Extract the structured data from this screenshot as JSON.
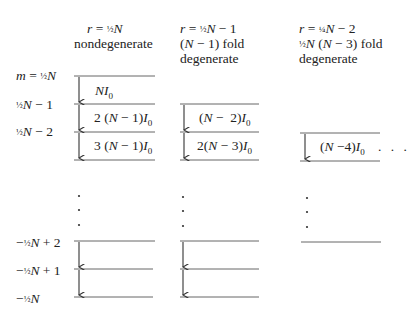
{
  "columns": [
    {
      "header_line1": "r = ½N",
      "header_line2": "nondegenerate",
      "header_line3": "",
      "transitions": [
        "NI₀",
        "2 (N − 1)I₀",
        "3 (N − 1)I₀"
      ]
    },
    {
      "header_line1": "r = ½N − 1",
      "header_line2": "(N − 1) fold",
      "header_line3": "degenerate",
      "transitions": [
        "(N −  2)I₀",
        "2(N − 3)I₀"
      ]
    },
    {
      "header_line1": "r = ¼N − 2",
      "header_line2": "½N (N − 3) fold",
      "header_line3": "degenerate",
      "transitions": [
        "(N −4)I₀"
      ],
      "trailing": ". . ."
    }
  ],
  "m_labels": {
    "top": [
      "m = ½N",
      "½N − 1",
      "½N − 2"
    ],
    "bottom": [
      "−½N + 2",
      "−½N + 1",
      "−½N"
    ]
  },
  "ellipsis": "·"
}
